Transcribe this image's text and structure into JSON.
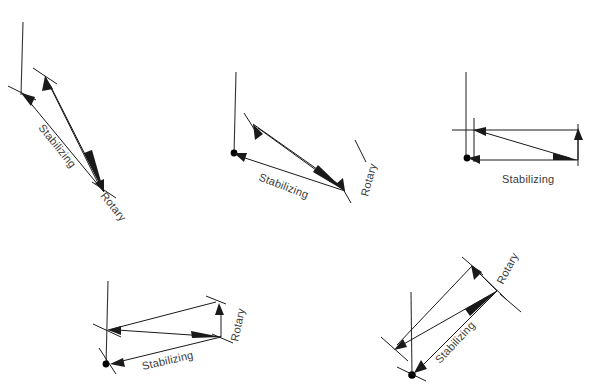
{
  "figure": {
    "title": "",
    "background_color": "#ffffff",
    "line_color": "#1a1a1a",
    "label_color": "#3a3a3a",
    "width": 591,
    "height": 389,
    "panel_count": 5
  },
  "labels": {
    "stabilizing": "Stabilizing",
    "rotary": "Rotary"
  },
  "panels": [
    {
      "id": "panel-1",
      "position": "top-left",
      "reference_line": {
        "x1": 23,
        "y1": 22,
        "x2": 21,
        "y2": 93
      },
      "origin": {
        "x": 21,
        "y": 93
      },
      "vectors": [
        {
          "name": "stabilizing",
          "from": {
            "x": 104,
            "y": 192
          },
          "to": {
            "x": 24,
            "y": 95
          },
          "label": "Stabilizing",
          "label_x": 60,
          "label_y": 145,
          "label_rotation": 50
        },
        {
          "name": "rotary",
          "from": {
            "x": 104,
            "y": 192
          },
          "to": {
            "x": 45,
            "y": 76
          },
          "label": "Rotary",
          "label_x": 119,
          "label_y": 202,
          "label_rotation": 50
        }
      ],
      "resultant": {
        "from": {
          "x": 21,
          "y": 93
        },
        "to": {
          "x": 104,
          "y": 192
        }
      },
      "rotary_dimension": {
        "from": {
          "x": 45,
          "y": 76
        },
        "to": {
          "x": 104,
          "y": 192
        }
      }
    },
    {
      "id": "panel-2",
      "position": "top-center",
      "reference_line": {
        "x1": 236,
        "y1": 72,
        "x2": 234,
        "y2": 153
      },
      "origin": {
        "x": 234,
        "y": 153
      },
      "vectors": [
        {
          "name": "stabilizing",
          "from": {
            "x": 345,
            "y": 191
          },
          "to": {
            "x": 236,
            "y": 155
          },
          "label": "Stabilizing",
          "label_x": 262,
          "label_y": 172,
          "label_rotation": 20
        },
        {
          "name": "rotary",
          "from": {
            "x": 345,
            "y": 191
          },
          "to": {
            "x": 253,
            "y": 124
          },
          "label": "Rotary",
          "label_x": 367,
          "label_y": 196,
          "label_rotation": 72
        }
      ],
      "resultant": {
        "from": {
          "x": 234,
          "y": 153
        },
        "to": {
          "x": 345,
          "y": 191
        }
      },
      "rotary_dimension": {
        "from": {
          "x": 253,
          "y": 124
        },
        "to": {
          "x": 345,
          "y": 191
        }
      }
    },
    {
      "id": "panel-3",
      "position": "top-right",
      "reference_line": {
        "x1": 466,
        "y1": 72,
        "x2": 466,
        "y2": 160
      },
      "origin": {
        "x": 467,
        "y": 158
      },
      "vectors": [
        {
          "name": "stabilizing",
          "from": {
            "x": 578,
            "y": 160
          },
          "to": {
            "x": 469,
            "y": 158
          },
          "label": "Stabilizing",
          "label_x": 499,
          "label_y": 183,
          "label_rotation": 0
        },
        {
          "name": "rotary",
          "from": {
            "x": 578,
            "y": 160
          },
          "to": {
            "x": 474,
            "y": 130
          },
          "label": "",
          "label_x": 0,
          "label_y": 0,
          "label_rotation": 0
        }
      ],
      "resultant": {
        "from": {
          "x": 467,
          "y": 158
        },
        "to": {
          "x": 578,
          "y": 160
        }
      },
      "rotary_dimension": {
        "from": {
          "x": 474,
          "y": 130
        },
        "to": {
          "x": 578,
          "y": 160
        }
      }
    },
    {
      "id": "panel-4",
      "position": "bottom-left",
      "reference_line": {
        "x1": 108,
        "y1": 281,
        "x2": 106,
        "y2": 364
      },
      "origin": {
        "x": 106,
        "y": 364
      },
      "vectors": [
        {
          "name": "stabilizing",
          "from": {
            "x": 221,
            "y": 337
          },
          "to": {
            "x": 110,
            "y": 364
          },
          "label": "Stabilizing",
          "label_x": 142,
          "label_y": 365,
          "label_rotation": -13
        },
        {
          "name": "rotary",
          "from": {
            "x": 221,
            "y": 337
          },
          "to": {
            "x": 108,
            "y": 330
          },
          "label": "Rotary",
          "label_x": 238,
          "label_y": 340,
          "label_rotation": -78
        }
      ],
      "resultant": {
        "from": {
          "x": 106,
          "y": 364
        },
        "to": {
          "x": 221,
          "y": 337
        }
      },
      "rotary_dimension": {
        "from": {
          "x": 215,
          "y": 300
        },
        "to": {
          "x": 224,
          "y": 345
        }
      }
    },
    {
      "id": "panel-5",
      "position": "bottom-right",
      "reference_line": {
        "x1": 411,
        "y1": 292,
        "x2": 412,
        "y2": 377
      },
      "origin": {
        "x": 412,
        "y": 375
      },
      "vectors": [
        {
          "name": "stabilizing",
          "from": {
            "x": 497,
            "y": 291
          },
          "to": {
            "x": 415,
            "y": 373
          },
          "label": "Stabilizing",
          "label_x": 452,
          "label_y": 352,
          "label_rotation": -47
        },
        {
          "name": "rotary",
          "from": {
            "x": 497,
            "y": 291
          },
          "to": {
            "x": 472,
            "y": 266
          },
          "label": "Rotary",
          "label_x": 498,
          "label_y": 282,
          "label_rotation": -62
        }
      ],
      "resultant": {
        "from": {
          "x": 412,
          "y": 375
        },
        "to": {
          "x": 497,
          "y": 291
        }
      },
      "rotary_dimension": {
        "from": {
          "x": 472,
          "y": 266
        },
        "to": {
          "x": 510,
          "y": 303
        }
      },
      "extra_vector": {
        "from": {
          "x": 497,
          "y": 291
        },
        "to": {
          "x": 394,
          "y": 350
        }
      }
    }
  ]
}
